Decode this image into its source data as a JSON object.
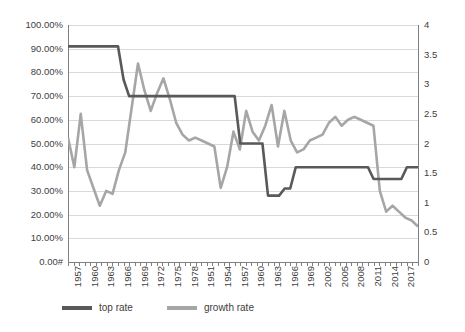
{
  "chart_data": {
    "type": "line",
    "title": "",
    "xlabel": "",
    "grid": true,
    "legend_position": "bottom",
    "x_tick_labels": [
      "1957",
      "1960",
      "1963",
      "1966",
      "1969",
      "1972",
      "1975",
      "1978",
      "1951",
      "1954",
      "1957",
      "1960",
      "1963",
      "1966",
      "1969",
      "2002",
      "2005",
      "2008",
      "2011",
      "2014",
      "2017"
    ],
    "axes": {
      "left": {
        "label": "",
        "ylim": [
          0,
          1
        ],
        "format": "percent",
        "tick_labels": [
          "100.00%",
          "90.00%",
          "80.00%",
          "70.00%",
          "60.00%",
          "50.00%",
          "40.00%",
          "30.00%",
          "20.00%",
          "10.00%",
          "0.00#"
        ],
        "tick_values": [
          1.0,
          0.9,
          0.8,
          0.7,
          0.6,
          0.5,
          0.4,
          0.3,
          0.2,
          0.1,
          0.0
        ]
      },
      "right": {
        "label": "",
        "ylim": [
          0,
          4
        ],
        "tick_labels": [
          "4",
          "3.5",
          "3",
          "2.5",
          "2",
          "1.5",
          "1",
          "0.5",
          "0"
        ],
        "tick_values": [
          4,
          3.5,
          3,
          2.5,
          2,
          1.5,
          1,
          0.5,
          0
        ]
      }
    },
    "series": [
      {
        "name": "top rate",
        "axis": "left",
        "color": "#595959",
        "values": [
          0.91,
          0.91,
          0.91,
          0.91,
          0.91,
          0.91,
          0.91,
          0.91,
          0.91,
          0.91,
          0.77,
          0.7,
          0.7,
          0.7,
          0.7,
          0.7,
          0.7,
          0.7,
          0.7,
          0.7,
          0.7,
          0.7,
          0.7,
          0.7,
          0.7,
          0.7,
          0.7,
          0.7,
          0.7,
          0.7,
          0.7,
          0.5,
          0.5,
          0.5,
          0.5,
          0.5,
          0.28,
          0.28,
          0.28,
          0.31,
          0.31,
          0.4,
          0.4,
          0.4,
          0.4,
          0.4,
          0.4,
          0.4,
          0.4,
          0.4,
          0.4,
          0.4,
          0.4,
          0.4,
          0.4,
          0.35,
          0.35,
          0.35,
          0.35,
          0.35,
          0.35,
          0.4,
          0.4,
          0.4
        ]
      },
      {
        "name": "growth rate",
        "axis": "right",
        "color": "#a6a6a6",
        "values": [
          2.1,
          1.6,
          2.5,
          1.55,
          1.25,
          0.95,
          1.2,
          1.15,
          1.55,
          1.85,
          2.6,
          3.35,
          2.9,
          2.55,
          2.85,
          3.1,
          2.75,
          2.35,
          2.15,
          2.05,
          2.1,
          2.05,
          2.0,
          1.95,
          1.25,
          1.6,
          2.2,
          1.9,
          2.55,
          2.2,
          2.05,
          2.3,
          2.65,
          1.95,
          2.55,
          2.05,
          1.85,
          1.9,
          2.05,
          2.1,
          2.15,
          2.35,
          2.45,
          2.3,
          2.4,
          2.45,
          2.4,
          2.35,
          2.3,
          1.2,
          0.85,
          0.95,
          0.85,
          0.75,
          0.7,
          0.6
        ]
      }
    ]
  },
  "legend": {
    "items": [
      {
        "label": "top rate",
        "color": "#595959"
      },
      {
        "label": "growth rate",
        "color": "#a6a6a6"
      }
    ]
  }
}
